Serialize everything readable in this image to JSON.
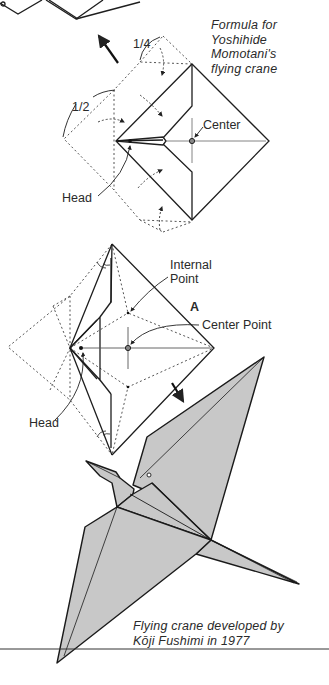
{
  "captions": {
    "formula": [
      "Formula for",
      "Yoshihide",
      "Momotani's",
      "flying crane"
    ],
    "crane": [
      "Flying crane developed by",
      "Kōji Fushimi in 1977"
    ]
  },
  "diagram1": {
    "fraction_quarter": "1/4",
    "fraction_half": "1/2",
    "center_label": "Center",
    "head_label": "Head"
  },
  "diagram2": {
    "internal_point_label": [
      "Internal",
      "Point"
    ],
    "point_a_label": "A",
    "center_point_label": "Center Point",
    "head_label": "Head"
  },
  "colors": {
    "line": "#1e1e1e",
    "dotted": "#555555",
    "paper_fill": "#c8c8c8",
    "background": "#ffffff"
  }
}
